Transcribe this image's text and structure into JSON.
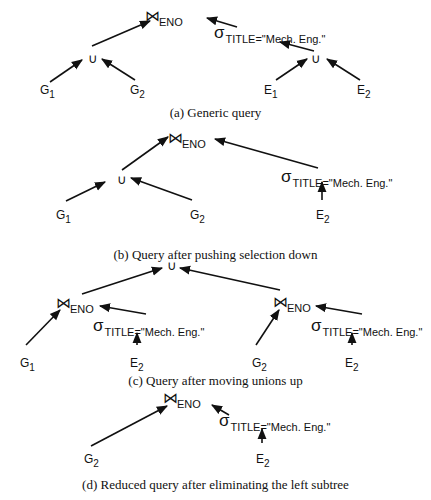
{
  "figure": {
    "panels": [
      {
        "id": "a",
        "caption": "(a) Generic query",
        "caption_y": 105,
        "joins": [
          {
            "x": 145,
            "y": 8,
            "sym": "⋈",
            "attr": "ENO"
          }
        ],
        "unions": [
          {
            "x": 88,
            "y": 52
          },
          {
            "x": 311,
            "y": 52
          }
        ],
        "selects": [
          {
            "x": 214,
            "y": 24,
            "sigma": "σ",
            "cond": "TITLE=\"Mech. Eng.\""
          }
        ],
        "leaves": [
          {
            "x": 40,
            "y": 84,
            "name": "G",
            "sub": "1"
          },
          {
            "x": 130,
            "y": 84,
            "name": "G",
            "sub": "2"
          },
          {
            "x": 264,
            "y": 84,
            "name": "E",
            "sub": "1"
          },
          {
            "x": 357,
            "y": 84,
            "name": "E",
            "sub": "2"
          }
        ],
        "edges": [
          [
            92,
            46,
            150,
            21
          ],
          [
            50,
            82,
            82,
            60
          ],
          [
            135,
            80,
            102,
            59
          ],
          [
            237,
            27,
            207,
            18
          ],
          [
            314,
            51,
            280,
            42
          ],
          [
            276,
            80,
            307,
            59
          ],
          [
            360,
            80,
            327,
            59
          ]
        ]
      },
      {
        "id": "b",
        "caption": "(b) Query after pushing selection down",
        "caption_y": 247,
        "joins": [
          {
            "x": 168,
            "y": 130,
            "sym": "⋈",
            "attr": "ENO"
          }
        ],
        "unions": [
          {
            "x": 117,
            "y": 173
          }
        ],
        "selects": [
          {
            "x": 281,
            "y": 168,
            "sigma": "σ",
            "cond": "TITLE=\"Mech. Eng.\""
          }
        ],
        "leaves": [
          {
            "x": 56,
            "y": 209,
            "name": "G",
            "sub": "1"
          },
          {
            "x": 190,
            "y": 209,
            "name": "G",
            "sub": "2"
          },
          {
            "x": 316,
            "y": 209,
            "name": "E",
            "sub": "2"
          }
        ],
        "edges": [
          [
            122,
            170,
            168,
            137
          ],
          [
            66,
            201,
            105,
            182
          ],
          [
            192,
            200,
            131,
            178
          ],
          [
            318,
            168,
            215,
            139
          ],
          [
            322,
            200,
            322,
            182
          ]
        ]
      },
      {
        "id": "c",
        "caption": "(c) Query after moving unions up",
        "caption_y": 373,
        "joins": [
          {
            "x": 56,
            "y": 295,
            "sym": "⋈",
            "attr": "ENO"
          },
          {
            "x": 273,
            "y": 294,
            "sym": "⋈",
            "attr": "ENO"
          }
        ],
        "unions": [
          {
            "x": 167,
            "y": 259
          }
        ],
        "selects": [
          {
            "x": 93,
            "y": 317,
            "sigma": "σ",
            "cond": "TITLE=\"Mech. Eng.\""
          },
          {
            "x": 311,
            "y": 317,
            "sigma": "σ",
            "cond": "TITLE=\"Mech. Eng.\""
          }
        ],
        "leaves": [
          {
            "x": 20,
            "y": 357,
            "name": "G",
            "sub": "1"
          },
          {
            "x": 130,
            "y": 357,
            "name": "E",
            "sub": "2"
          },
          {
            "x": 252,
            "y": 357,
            "name": "G",
            "sub": "2"
          },
          {
            "x": 345,
            "y": 357,
            "name": "E",
            "sub": "2"
          }
        ],
        "edges": [
          [
            82,
            294,
            162,
            268
          ],
          [
            280,
            290,
            180,
            268
          ],
          [
            26,
            345,
            60,
            310
          ],
          [
            146,
            314,
            100,
            306
          ],
          [
            137,
            345,
            137,
            333
          ],
          [
            256,
            345,
            279,
            310
          ],
          [
            362,
            314,
            316,
            306
          ],
          [
            352,
            345,
            352,
            333
          ]
        ]
      },
      {
        "id": "d",
        "caption": "(d) Reduced query after eliminating the left subtree",
        "caption_y": 477,
        "joins": [
          {
            "x": 163,
            "y": 390,
            "sym": "⋈",
            "attr": "ENO"
          }
        ],
        "unions": [],
        "selects": [
          {
            "x": 219,
            "y": 412,
            "sigma": "σ",
            "cond": "TITLE=\"Mech. Eng.\""
          }
        ],
        "leaves": [
          {
            "x": 84,
            "y": 453,
            "name": "G",
            "sub": "2"
          },
          {
            "x": 256,
            "y": 453,
            "name": "E",
            "sub": "2"
          }
        ],
        "edges": [
          [
            91,
            446,
            167,
            406
          ],
          [
            229,
            415,
            212,
            405
          ],
          [
            262,
            443,
            262,
            429
          ]
        ]
      }
    ],
    "colors": {
      "ink": "#111111",
      "background": "#ffffff"
    }
  }
}
